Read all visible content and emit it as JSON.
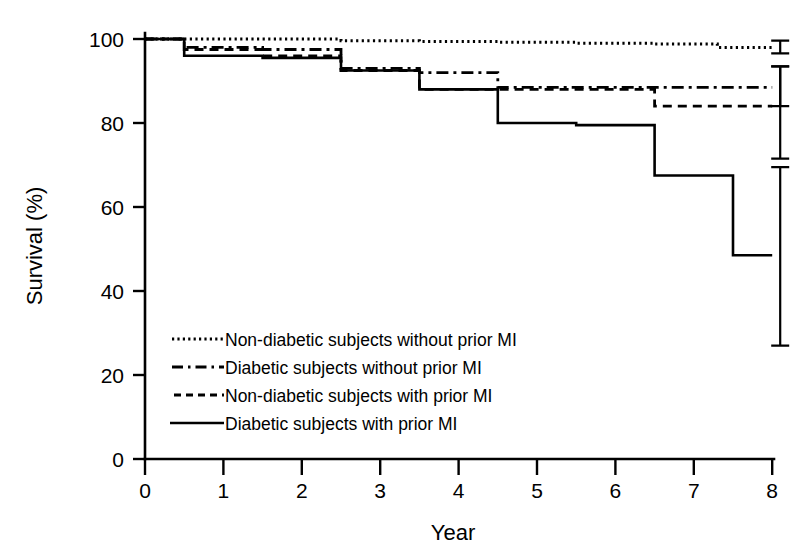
{
  "chart_data": {
    "type": "line",
    "subtype": "kaplan-meier-step",
    "title": "",
    "xlabel": "Year",
    "ylabel": "Survival (%)",
    "xlim": [
      0,
      8
    ],
    "ylim": [
      0,
      100
    ],
    "xticks": [
      "0",
      "1",
      "2",
      "3",
      "4",
      "5",
      "6",
      "7",
      "8"
    ],
    "yticks": [
      "0",
      "20",
      "40",
      "60",
      "80",
      "100"
    ],
    "grid": false,
    "legend_position": "lower-left-inside",
    "series": [
      {
        "name": "Non-diabetic subjects without prior MI",
        "style": "dotted",
        "color": "#000000",
        "x": [
          0,
          0.5,
          1.5,
          2.5,
          3.5,
          4.5,
          5.5,
          6.5,
          7.3,
          8
        ],
        "y": [
          100,
          100,
          100,
          99.6,
          99.4,
          99.2,
          99.0,
          98.8,
          98.0,
          98.0
        ],
        "endpoint": 98.0,
        "error_bar": {
          "x": 8,
          "value": 98.0,
          "low": 96.6,
          "high": 99.6
        }
      },
      {
        "name": "Diabetic subjects without prior MI",
        "style": "dash-dot",
        "color": "#000000",
        "x": [
          0,
          0.5,
          1.5,
          2.5,
          3.5,
          4.5,
          5.5,
          6.5,
          7.5,
          8
        ],
        "y": [
          100,
          98.0,
          97.5,
          93.0,
          92.0,
          88.5,
          88.5,
          88.5,
          88.5,
          88.5
        ],
        "endpoint": 88.5,
        "error_bar": {
          "x": 8,
          "value": 88.5,
          "low": 84.0,
          "high": 93.5
        }
      },
      {
        "name": "Non-diabetic subjects with prior MI",
        "style": "dashed",
        "color": "#000000",
        "x": [
          0,
          0.5,
          1.5,
          2.5,
          3.5,
          4.5,
          5.5,
          6.5,
          7.5,
          8
        ],
        "y": [
          100,
          97.5,
          96.0,
          92.5,
          88.0,
          88.0,
          88.0,
          84.0,
          84.0,
          84.0
        ],
        "endpoint": 84.0,
        "error_bar": {
          "x": 8,
          "value": 84.0,
          "low": 71.5,
          "high": 93.5
        }
      },
      {
        "name": "Diabetic subjects with prior MI",
        "style": "solid",
        "color": "#000000",
        "x": [
          0,
          0.5,
          1.5,
          2.5,
          3.5,
          4.5,
          5.5,
          6.5,
          7.5,
          8
        ],
        "y": [
          100,
          96.0,
          95.5,
          92.5,
          88.0,
          80.0,
          79.5,
          67.5,
          48.5,
          48.5
        ],
        "endpoint": 48.5,
        "error_bar": {
          "x": 8,
          "value": 48.5,
          "low": 27.0,
          "high": 69.5
        }
      }
    ]
  },
  "axes": {
    "x_title": "Year",
    "y_title": "Survival (%)"
  },
  "legend": {
    "items": [
      {
        "label": "Non-diabetic subjects without prior MI",
        "style": "dotted"
      },
      {
        "label": "Diabetic subjects without prior MI",
        "style": "dash-dot"
      },
      {
        "label": "Non-diabetic subjects with prior MI",
        "style": "dashed"
      },
      {
        "label": "Diabetic subjects with prior MI",
        "style": "solid"
      }
    ]
  }
}
